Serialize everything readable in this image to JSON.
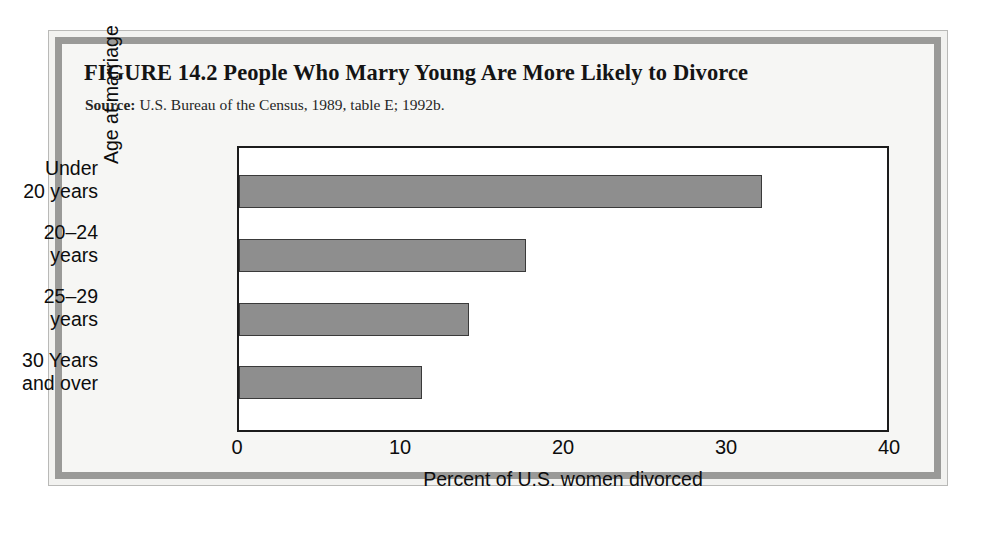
{
  "figure": {
    "title": "FIGURE 14.2  People Who Marry Young Are More Likely to Divorce",
    "source_label": "Source:",
    "source_text": " U.S. Bureau of the Census, 1989, table E; 1992b."
  },
  "chart_data": {
    "type": "bar",
    "orientation": "horizontal",
    "title": "People Who Marry Young Are More Likely to Divorce",
    "categories": [
      "Under 20 years",
      "20–24 years",
      "25–29 years",
      "30 Years and over"
    ],
    "category_lines": [
      [
        "Under",
        "20 years"
      ],
      [
        "20–24",
        "years"
      ],
      [
        "25–29",
        "years"
      ],
      [
        "30 Years",
        "and over"
      ]
    ],
    "values": [
      32.3,
      17.7,
      14.2,
      11.3
    ],
    "xlabel": "Percent of U.S. women divorced",
    "ylabel": "Age at marriage",
    "xlim": [
      0,
      40
    ],
    "xticks": [
      "0",
      "10",
      "20",
      "30",
      "40"
    ],
    "xtick_values": [
      0,
      10,
      20,
      30,
      40
    ],
    "grid": false,
    "legend": false,
    "bar_fill_color": "#8e8e8e",
    "bar_edge_color": "#3a3a3a",
    "plot_background": "#ffffff",
    "frame_color": "#9a9a98",
    "page_background": "#f6f6f4"
  }
}
